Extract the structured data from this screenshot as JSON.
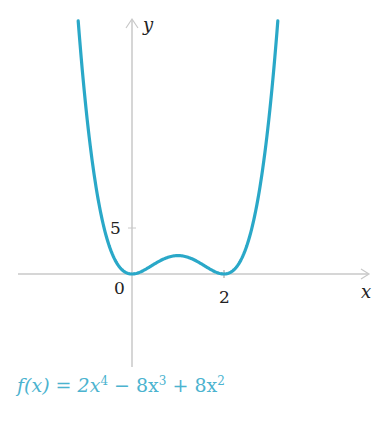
{
  "chart_data": {
    "type": "line",
    "title": "",
    "function_label": "f(x) = 2x⁴ − 8x³ + 8x²",
    "series": [
      {
        "name": "f(x) = 2x^4 - 8x^3 + 8x^2",
        "x": [
          -1.17,
          -1.0,
          -0.75,
          -0.5,
          -0.25,
          0,
          0.25,
          0.5,
          0.75,
          1.0,
          1.25,
          1.5,
          1.75,
          2.0,
          2.25,
          2.5,
          2.75,
          3.0,
          3.17
        ],
        "values": [
          27.5,
          18,
          9.63,
          3.13,
          0.63,
          0,
          0.38,
          1.13,
          1.76,
          2,
          1.76,
          1.13,
          0.38,
          0,
          0.63,
          3.13,
          9.63,
          18,
          27.5
        ],
        "color": "#2aa8c8"
      }
    ],
    "xlabel": "x",
    "ylabel": "y",
    "x_ticks": [
      0,
      2
    ],
    "x_tick_labels": [
      "0",
      "2"
    ],
    "y_ticks": [
      5
    ],
    "y_tick_labels": [
      "5"
    ],
    "xlim": [
      -2.5,
      5.1
    ],
    "ylim": [
      -10,
      28
    ],
    "grid": false,
    "legend": "none"
  },
  "labels": {
    "x_axis": "x",
    "y_axis": "y",
    "origin": "0",
    "x_tick_2": "2",
    "y_tick_5": "5"
  },
  "formula": {
    "prefix": "f(x) = 2x",
    "exp1": "4",
    "mid1": " − 8x",
    "exp2": "3",
    "mid2": " + 8x",
    "exp3": "2"
  }
}
